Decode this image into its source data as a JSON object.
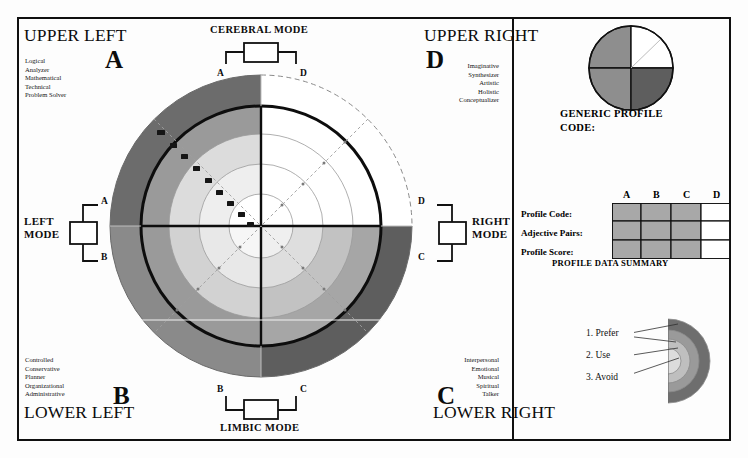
{
  "quadrants": {
    "upper_left": {
      "corner_label": "UPPER LEFT",
      "letter": "A",
      "traits": [
        "Logical",
        "Analyzer",
        "Mathematical",
        "Technical",
        "Problem Solver"
      ]
    },
    "upper_right": {
      "corner_label": "UPPER RIGHT",
      "letter": "D",
      "traits": [
        "Imaginative",
        "Synthesizer",
        "Artistic",
        "Holistic",
        "Conceptualizer"
      ]
    },
    "lower_left": {
      "corner_label": "LOWER LEFT",
      "letter": "B",
      "traits": [
        "Controlled",
        "Conservative",
        "Planner",
        "Organizational",
        "Administrative"
      ]
    },
    "lower_right": {
      "corner_label": "LOWER RIGHT",
      "letter": "C",
      "traits": [
        "Interpersonal",
        "Emotional",
        "Musical",
        "Spiritual",
        "Talker"
      ]
    }
  },
  "modes": {
    "cerebral": {
      "label": "CEREBRAL MODE",
      "left_node": "A",
      "right_node": "D"
    },
    "limbic": {
      "label": "LIMBIC MODE",
      "left_node": "B",
      "right_node": "C"
    },
    "left": {
      "label_line1": "LEFT",
      "label_line2": "MODE",
      "top_node": "A",
      "bottom_node": "B"
    },
    "right": {
      "label_line1": "RIGHT",
      "label_line2": "MODE",
      "top_node": "D",
      "bottom_node": "C"
    }
  },
  "scale": {
    "tick_labels": [
      "10",
      "20",
      "44",
      "62",
      "80",
      "92",
      "100",
      "114",
      "126"
    ],
    "axis_note": "plotted scale on upper-left diagonal"
  },
  "generic_profile": {
    "caption_line1": "GENERIC PROFILE",
    "caption_line2": "CODE:",
    "slices": [
      {
        "quadrant": "A",
        "fill": "#8e8e8e"
      },
      {
        "quadrant": "D",
        "fill": "#ffffff"
      },
      {
        "quadrant": "B",
        "fill": "#8e8e8e"
      },
      {
        "quadrant": "C",
        "fill": "#5e5e5e"
      }
    ]
  },
  "summary_table": {
    "caption": "PROFILE DATA SUMMARY",
    "columns": [
      "A",
      "B",
      "C",
      "D"
    ],
    "rows": [
      "Profile Code:",
      "Adjective Pairs:",
      "Profile Score:"
    ],
    "cell_fills": [
      [
        "#a8a8a8",
        "#a8a8a8",
        "#a8a8a8",
        "#ffffff"
      ],
      [
        "#a8a8a8",
        "#a8a8a8",
        "#a8a8a8",
        "#ffffff"
      ],
      [
        "#a8a8a8",
        "#a8a8a8",
        "#a8a8a8",
        "#ffffff"
      ]
    ]
  },
  "legend": {
    "items": [
      {
        "number": "1.",
        "label": "Prefer"
      },
      {
        "number": "2.",
        "label": "Use"
      },
      {
        "number": "3.",
        "label": "Avoid"
      }
    ]
  },
  "colors": {
    "ring_outer_dark": "#6c6c6c",
    "ring_mid": "#9a9a9a",
    "ring_inner": "#c9c9c9",
    "ring_core": "#e4e4e4",
    "white": "#ffffff",
    "stroke": "#101010",
    "faint": "#b4b4b4"
  }
}
